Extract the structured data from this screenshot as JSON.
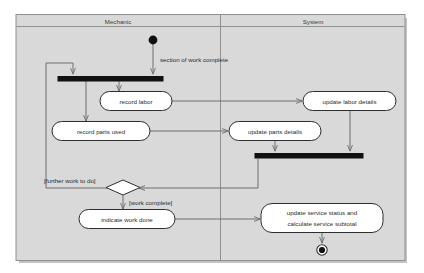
{
  "diagram": {
    "type": "uml-activity-diagram",
    "panel": {
      "background_color": "#d9d9d9",
      "border_color": "#8c8c8c",
      "shadow_color": "#b8b8b8"
    },
    "swimlanes": [
      {
        "id": "mechanic",
        "title": "Mechanic"
      },
      {
        "id": "system",
        "title": "System"
      }
    ],
    "nodes": [
      {
        "id": "start",
        "kind": "initial-node",
        "lane": "mechanic",
        "label": ""
      },
      {
        "id": "fork-bar",
        "kind": "fork-bar",
        "lane": "mechanic",
        "label": ""
      },
      {
        "id": "record-labor",
        "kind": "action",
        "lane": "mechanic",
        "label": "record labor"
      },
      {
        "id": "record-parts-used",
        "kind": "action",
        "lane": "mechanic",
        "label": "record parts used"
      },
      {
        "id": "update-labor-details",
        "kind": "action",
        "lane": "system",
        "label": "update labor details"
      },
      {
        "id": "update-parts-details",
        "kind": "action",
        "lane": "system",
        "label": "update parts details"
      },
      {
        "id": "join-bar",
        "kind": "join-bar",
        "lane": "system",
        "label": ""
      },
      {
        "id": "decision",
        "kind": "decision",
        "lane": "mechanic",
        "label": ""
      },
      {
        "id": "indicate-work-done",
        "kind": "action",
        "lane": "mechanic",
        "label": "indicate work done"
      },
      {
        "id": "update-service-status",
        "kind": "action",
        "lane": "system",
        "label_line1": "update service status and",
        "label_line2": "calculate service subtotal"
      },
      {
        "id": "end",
        "kind": "final-node",
        "lane": "system",
        "label": ""
      }
    ],
    "edge_labels": {
      "section_of_work_complete": "section of work complete",
      "further_work_to_do": "[further work to do]",
      "work_complete": "[work complete]"
    }
  }
}
